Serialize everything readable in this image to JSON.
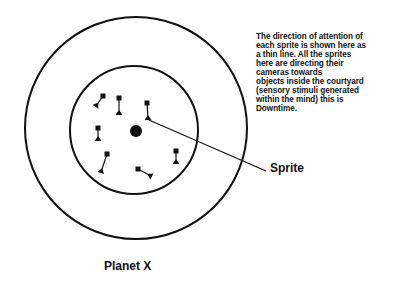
{
  "caption": {
    "lines": [
      "The direction of attention of",
      "each sprite is shown here as",
      "a thin line.  All the sprites",
      "here are directing their",
      "cameras towards",
      "objects inside the courtyard",
      "(sensory stimuli generated",
      "within the mind) this is",
      "Downtime."
    ]
  },
  "labels": {
    "sprite": "Sprite",
    "planet": "Planet X"
  },
  "diagram": {
    "outer_circle": {
      "cx": 136,
      "cy": 128,
      "r": 111
    },
    "inner_circle": {
      "cx": 134,
      "cy": 130,
      "r": 64
    },
    "core": {
      "cx": 136,
      "cy": 131,
      "r": 6
    },
    "sprites": [
      {
        "camera": [
          103,
          96
        ],
        "eye": [
          96,
          106
        ]
      },
      {
        "camera": [
          119,
          98
        ],
        "eye": [
          119,
          114
        ]
      },
      {
        "camera": [
          147,
          103
        ],
        "eye": [
          148,
          119
        ]
      },
      {
        "camera": [
          98,
          128
        ],
        "eye": [
          98,
          140
        ]
      },
      {
        "camera": [
          107,
          154
        ],
        "eye": [
          101,
          172
        ]
      },
      {
        "camera": [
          176,
          151
        ],
        "eye": [
          176,
          163
        ]
      },
      {
        "camera": [
          138,
          169
        ],
        "eye": [
          151,
          176
        ]
      }
    ],
    "pointer": {
      "from": [
        149,
        120
      ],
      "to": [
        266,
        171
      ]
    },
    "stroke_color": "#111111"
  }
}
